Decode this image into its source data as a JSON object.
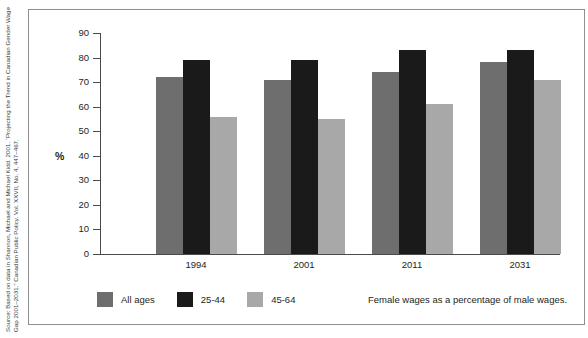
{
  "source_note": "Source: Based on data in Shannon, Michael and Michael Kidd. 2001. “Projecting the Trend in Canadian Gender Wage Gap 2001–2031.” Canadian Public Policy. Vol. XXVII, No. 4, 447–467.",
  "caption": "Female wages as a percentage of male wages.",
  "legend": {
    "items": [
      {
        "label": "All ages",
        "color": "#6e6e6e",
        "swatch_name": "legend-swatch-all-ages"
      },
      {
        "label": "25-44",
        "color": "#1a1a1a",
        "swatch_name": "legend-swatch-25-44"
      },
      {
        "label": "45-64",
        "color": "#a8a8a8",
        "swatch_name": "legend-swatch-45-64"
      }
    ]
  },
  "chart_data": {
    "type": "bar",
    "title": "",
    "subtitle": "",
    "xlabel": "",
    "ylabel": "%",
    "categories": [
      "1994",
      "2001",
      "2011",
      "2031"
    ],
    "series": [
      {
        "name": "All ages",
        "color": "#6e6e6e",
        "values": [
          72,
          71,
          74,
          78
        ]
      },
      {
        "name": "25-44",
        "color": "#1a1a1a",
        "values": [
          79,
          79,
          83,
          83
        ]
      },
      {
        "name": "45-64",
        "color": "#a8a8a8",
        "values": [
          56,
          55,
          61,
          71
        ]
      }
    ],
    "ylim": [
      0,
      90
    ],
    "yticks": [
      0,
      10,
      20,
      30,
      40,
      50,
      60,
      70,
      80,
      90
    ],
    "ytick_labels": [
      "0",
      "10",
      "20",
      "30",
      "40",
      "50",
      "60",
      "70",
      "80",
      "90"
    ],
    "grid": false,
    "legend_position": "bottom-left",
    "annotations": [
      "Female wages as a percentage of male wages."
    ]
  },
  "colors": {
    "frame": "#8f8f8f",
    "axis": "#4a4a4a",
    "text": "#231f20",
    "background": "#ffffff"
  }
}
